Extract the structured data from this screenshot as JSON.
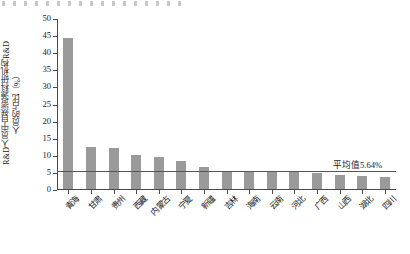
{
  "chart_data": {
    "type": "bar",
    "title": "",
    "xlabel": "",
    "ylabel": "R&D人员中自然资源科研机构R&D人员的占比（%）",
    "ylabel_lines": [
      "R&D人员中自然资源科研机构R&D",
      "人员的占比（%）"
    ],
    "ylim": [
      0,
      50
    ],
    "yticks": [
      0,
      5,
      10,
      15,
      20,
      25,
      30,
      35,
      40,
      45,
      50
    ],
    "ytick_labels": [
      "0",
      "5",
      "10",
      "15",
      "20",
      "25",
      "30",
      "35",
      "40",
      "45",
      "50"
    ],
    "grid": false,
    "legend": "none",
    "categories": [
      "青海",
      "甘肃",
      "贵州",
      "西藏",
      "内蒙古",
      "宁夏",
      "新疆",
      "吉林",
      "海南",
      "云南",
      "河北",
      "广西",
      "山西",
      "湖北",
      "四川"
    ],
    "values": [
      44.2,
      12.2,
      11.9,
      10.0,
      9.3,
      8.3,
      6.3,
      5.4,
      5.4,
      5.0,
      5.0,
      4.8,
      4.2,
      3.8,
      3.5
    ],
    "bar_color": "#9a9a9a",
    "annotations": [
      {
        "name": "mean-line",
        "label": "平均值5.64%",
        "value": 5.64,
        "line_color": "#555555"
      }
    ]
  }
}
